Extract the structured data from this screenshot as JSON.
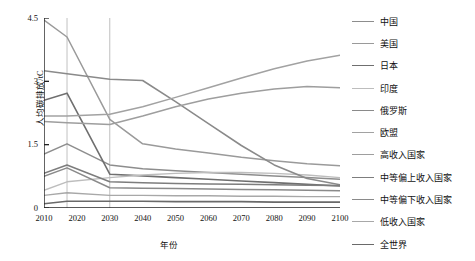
{
  "chart_data": {
    "type": "line",
    "title": "",
    "xlabel": "年份",
    "ylabel": "人均碳排放/tC",
    "xlim": [
      2010,
      2100
    ],
    "ylim": [
      0,
      4.5
    ],
    "yticks": [
      "0",
      "1.5",
      "3",
      "4.5"
    ],
    "ytick_values": [
      0,
      1.5,
      3,
      4.5
    ],
    "xticks": [
      "2010",
      "2020",
      "2030",
      "2040",
      "2050",
      "2060",
      "2070",
      "2080",
      "2090",
      "2100"
    ],
    "grid": "vertical gridlines at 2017 and 2030",
    "gridlines_x": [
      2017,
      2030
    ],
    "legend_position": "right",
    "x": [
      2010,
      2017,
      2030,
      2040,
      2050,
      2060,
      2070,
      2080,
      2090,
      2100
    ],
    "series": [
      {
        "name": "中国",
        "color": "#8d8d8d",
        "width": 1.5,
        "values": [
          1.28,
          1.52,
          1.02,
          0.93,
          0.88,
          0.84,
          0.8,
          0.76,
          0.72,
          0.68
        ]
      },
      {
        "name": "美国",
        "color": "#9a9a9a",
        "width": 1.5,
        "values": [
          4.45,
          4.05,
          2.1,
          1.52,
          1.4,
          1.3,
          1.2,
          1.12,
          1.05,
          1.0
        ]
      },
      {
        "name": "日本",
        "color": "#6f6f6f",
        "width": 1.6,
        "values": [
          2.55,
          2.72,
          0.8,
          0.76,
          0.72,
          0.68,
          0.64,
          0.6,
          0.56,
          0.52
        ]
      },
      {
        "name": "印度",
        "color": "#bdbdbd",
        "width": 1.4,
        "values": [
          0.42,
          0.62,
          0.72,
          0.78,
          0.82,
          0.84,
          0.84,
          0.82,
          0.78,
          0.72
        ]
      },
      {
        "name": "俄罗斯",
        "color": "#8a8a8a",
        "width": 1.6,
        "values": [
          3.25,
          3.18,
          3.05,
          3.02,
          2.52,
          2.0,
          1.48,
          1.02,
          0.7,
          0.55
        ]
      },
      {
        "name": "欧盟",
        "color": "#a2a2a2",
        "width": 1.5,
        "values": [
          2.18,
          2.18,
          2.22,
          2.4,
          2.62,
          2.85,
          3.08,
          3.3,
          3.48,
          3.62
        ]
      },
      {
        "name": "高收入国家",
        "color": "#9e9e9e",
        "width": 1.5,
        "values": [
          2.05,
          2.02,
          1.98,
          2.18,
          2.4,
          2.58,
          2.72,
          2.82,
          2.88,
          2.85
        ]
      },
      {
        "name": "中等偏上收入国家",
        "color": "#7d7d7d",
        "width": 1.5,
        "values": [
          0.82,
          1.02,
          0.62,
          0.6,
          0.58,
          0.57,
          0.56,
          0.55,
          0.54,
          0.53
        ]
      },
      {
        "name": "中等偏下收入国家",
        "color": "#8a8a8a",
        "width": 1.5,
        "values": [
          0.75,
          0.95,
          0.48,
          0.47,
          0.46,
          0.45,
          0.44,
          0.43,
          0.42,
          0.41
        ]
      },
      {
        "name": "低收入国家",
        "color": "#a8a8a8",
        "width": 1.4,
        "values": [
          0.3,
          0.36,
          0.3,
          0.3,
          0.29,
          0.29,
          0.28,
          0.28,
          0.27,
          0.27
        ]
      },
      {
        "name": "全世界",
        "color": "#6a6a6a",
        "width": 1.6,
        "values": [
          0.1,
          0.16,
          0.16,
          0.16,
          0.15,
          0.15,
          0.15,
          0.14,
          0.14,
          0.14
        ]
      }
    ]
  },
  "axis": {
    "ylabel": "人均碳排放/tC",
    "xlabel": "年份"
  }
}
